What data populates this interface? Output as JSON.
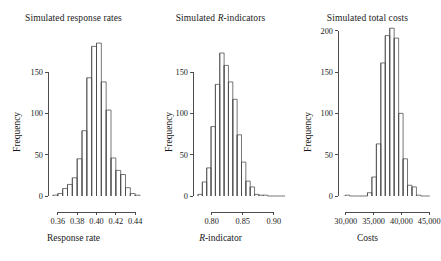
{
  "figure": {
    "background": "#ffffff",
    "ink": "#1a1a1a",
    "panel_count": 3
  },
  "chart_data": [
    {
      "type": "bar",
      "subtype": "histogram",
      "title": "Simulated response rates",
      "title_parts": [
        {
          "text": "Simulated response rates",
          "style": "normal"
        }
      ],
      "xlabel": "Response rate",
      "xlabel_parts": [
        {
          "text": "Response rate",
          "style": "normal"
        }
      ],
      "ylabel": "Frequency",
      "xlim": [
        0.355,
        0.445
      ],
      "ylim": [
        0,
        190
      ],
      "xticks": [
        0.36,
        0.38,
        0.4,
        0.42,
        0.44
      ],
      "xticklabels": [
        "0.36",
        "0.38",
        "0.40",
        "0.42",
        "0.44"
      ],
      "yticks": [
        0,
        50,
        100,
        150
      ],
      "yticklabels": [
        "0",
        "50",
        "100",
        "150"
      ],
      "grid": false,
      "legend": "none",
      "bin_width": 0.005,
      "bin_edges": [
        0.355,
        0.36,
        0.365,
        0.37,
        0.375,
        0.38,
        0.385,
        0.39,
        0.395,
        0.4,
        0.405,
        0.41,
        0.415,
        0.42,
        0.425,
        0.43,
        0.435,
        0.44,
        0.445
      ],
      "categories": [
        "0.355-0.360",
        "0.360-0.365",
        "0.365-0.370",
        "0.370-0.375",
        "0.375-0.380",
        "0.380-0.385",
        "0.385-0.390",
        "0.390-0.395",
        "0.395-0.400",
        "0.400-0.405",
        "0.405-0.410",
        "0.410-0.415",
        "0.415-0.420",
        "0.420-0.425",
        "0.425-0.430",
        "0.430-0.435",
        "0.435-0.440",
        "0.440-0.445"
      ],
      "values": [
        1,
        3,
        9,
        14,
        22,
        45,
        79,
        143,
        181,
        185,
        138,
        104,
        46,
        31,
        26,
        10,
        3,
        1
      ]
    },
    {
      "type": "bar",
      "subtype": "histogram",
      "title": "Simulated R-indicators",
      "title_parts": [
        {
          "text": "Simulated ",
          "style": "normal"
        },
        {
          "text": "R",
          "style": "italic"
        },
        {
          "text": "-indicators",
          "style": "normal"
        }
      ],
      "xlabel": "R-indicator",
      "xlabel_parts": [
        {
          "text": "R",
          "style": "italic"
        },
        {
          "text": "-indicator",
          "style": "normal"
        }
      ],
      "ylabel": "Frequency",
      "xlim": [
        0.778,
        0.918
      ],
      "ylim": [
        0,
        180
      ],
      "xticks": [
        0.8,
        0.85,
        0.9
      ],
      "xticklabels": [
        "0.80",
        "0.85",
        "0.90"
      ],
      "yticks": [
        0,
        50,
        100,
        150
      ],
      "yticklabels": [
        "0",
        "50",
        "100",
        "150"
      ],
      "grid": false,
      "legend": "none",
      "bin_width": 0.007,
      "bin_edges": [
        0.778,
        0.785,
        0.792,
        0.799,
        0.806,
        0.813,
        0.82,
        0.827,
        0.834,
        0.841,
        0.848,
        0.855,
        0.862,
        0.869,
        0.876,
        0.883,
        0.89,
        0.897,
        0.904,
        0.911,
        0.918
      ],
      "categories": [
        "b1",
        "b2",
        "b3",
        "b4",
        "b5",
        "b6",
        "b7",
        "b8",
        "b9",
        "b10",
        "b11",
        "b12",
        "b13",
        "b14",
        "b15",
        "b16",
        "b17",
        "b18",
        "b19",
        "b20"
      ],
      "values": [
        2,
        17,
        34,
        84,
        135,
        173,
        158,
        138,
        117,
        74,
        41,
        18,
        11,
        2,
        1,
        1,
        0,
        0,
        0,
        0
      ]
    },
    {
      "type": "bar",
      "subtype": "histogram",
      "title": "Simulated total costs",
      "title_parts": [
        {
          "text": "Simulated total costs",
          "style": "normal"
        }
      ],
      "xlabel": "Costs",
      "xlabel_parts": [
        {
          "text": "Costs",
          "style": "normal"
        }
      ],
      "ylabel": "Frequency",
      "xlim": [
        29500,
        45500
      ],
      "ylim": [
        0,
        212
      ],
      "xticks": [
        30000,
        35000,
        40000,
        45000
      ],
      "xticklabels": [
        "30,000",
        "35,000",
        "40,000",
        "45,000"
      ],
      "yticks": [
        0,
        50,
        100,
        150,
        200
      ],
      "yticklabels": [
        "0",
        "50",
        "100",
        "150",
        "200"
      ],
      "grid": false,
      "legend": "none",
      "bin_width": 800,
      "bin_edges": [
        29900,
        30700,
        31500,
        32300,
        33100,
        33900,
        34700,
        35500,
        36300,
        37100,
        37900,
        38700,
        39500,
        40300,
        41100,
        41900,
        42700,
        43500,
        44300,
        45100
      ],
      "categories": [
        "c1",
        "c2",
        "c3",
        "c4",
        "c5",
        "c6",
        "c7",
        "c8",
        "c9",
        "c10",
        "c11",
        "c12",
        "c13",
        "c14",
        "c15",
        "c16",
        "c17",
        "c18",
        "c19"
      ],
      "values": [
        1,
        0,
        0,
        0,
        0,
        4,
        23,
        63,
        161,
        194,
        203,
        191,
        100,
        45,
        13,
        11,
        1,
        0,
        0
      ]
    }
  ]
}
